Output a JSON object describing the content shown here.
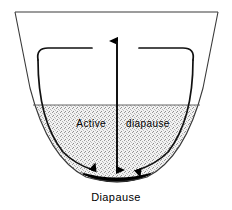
{
  "figure": {
    "labels": {
      "active_diapause_word1": "Active",
      "active_diapause_word2": "diapause",
      "diapause": "Diapause"
    },
    "regions": [
      {
        "name": "open-basin",
        "label": "",
        "fill": "#ffffff",
        "description": "upper open region of the vessel"
      },
      {
        "name": "active-diapause-zone",
        "label": "Active diapause",
        "fill": "#e0e0e0",
        "description": "stippled mid region"
      },
      {
        "name": "diapause-well",
        "label": "Diapause",
        "fill": "#000000",
        "description": "solid black bottom of the well"
      }
    ],
    "arrows": [
      {
        "name": "center-up-arrow",
        "direction": "up",
        "from": [
          117,
          172
        ],
        "to": [
          117,
          40
        ]
      },
      {
        "name": "center-down-arrow",
        "direction": "down",
        "from": [
          117,
          40
        ],
        "to": [
          117,
          172
        ]
      },
      {
        "name": "left-descending-arrow",
        "direction": "down-right",
        "from": [
          38,
          52
        ],
        "to": [
          95,
          168
        ]
      },
      {
        "name": "right-descending-arrow",
        "direction": "down-left",
        "from": [
          193,
          52
        ],
        "to": [
          139,
          168
        ]
      }
    ],
    "colors": {
      "outline": "#333333",
      "stroke": "#000000",
      "stipple": "#e2e2e2",
      "well": "#000000",
      "background": "#ffffff"
    }
  }
}
